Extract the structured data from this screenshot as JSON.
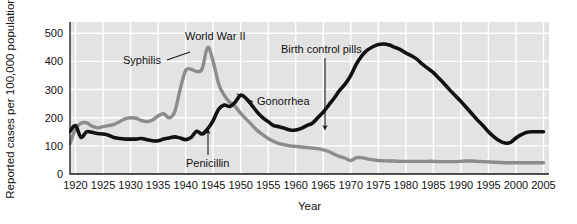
{
  "chart_data": {
    "type": "line",
    "title": "",
    "xlabel": "Year",
    "ylabel": "Reported cases per 100,000 population",
    "xlim": [
      1919,
      2006
    ],
    "ylim": [
      0,
      540
    ],
    "grid": true,
    "legend_position": "inline-annotations",
    "xticks": [
      1920,
      1925,
      1930,
      1935,
      1940,
      1945,
      1950,
      1955,
      1960,
      1965,
      1970,
      1975,
      1980,
      1985,
      1990,
      1995,
      2000,
      2005
    ],
    "xtick_labels": [
      "1920",
      "1925",
      "1930",
      "1935",
      "1940",
      "1945",
      "1950",
      "1955",
      "1960",
      "1965",
      "1970",
      "1975",
      "1980",
      "1985",
      "1990",
      "1995",
      "2000",
      "2005"
    ],
    "yticks": [
      0,
      100,
      200,
      300,
      400,
      500
    ],
    "ytick_labels": [
      "0",
      "100",
      "200",
      "300",
      "400",
      "500"
    ],
    "series": [
      {
        "name": "Syphilis",
        "color": "#8c8c8c",
        "stroke_width": 3.4,
        "x": [
          1919,
          1920,
          1921,
          1922,
          1923,
          1924,
          1925,
          1926,
          1927,
          1928,
          1929,
          1930,
          1931,
          1932,
          1933,
          1934,
          1935,
          1936,
          1937,
          1938,
          1939,
          1940,
          1941,
          1942,
          1943,
          1944,
          1945,
          1946,
          1947,
          1948,
          1949,
          1950,
          1951,
          1952,
          1953,
          1954,
          1955,
          1956,
          1957,
          1958,
          1959,
          1960,
          1961,
          1962,
          1963,
          1964,
          1965,
          1966,
          1967,
          1968,
          1969,
          1970,
          1971,
          1972,
          1973,
          1974,
          1975,
          1976,
          1977,
          1978,
          1979,
          1980,
          1981,
          1982,
          1983,
          1984,
          1985,
          1986,
          1987,
          1988,
          1989,
          1990,
          1991,
          1992,
          1993,
          1994,
          1995,
          1996,
          1997,
          1998,
          1999,
          2000,
          2001,
          2002,
          2003,
          2004,
          2005
        ],
        "y": [
          108,
          160,
          180,
          182,
          170,
          164,
          168,
          172,
          176,
          186,
          196,
          200,
          198,
          190,
          186,
          192,
          206,
          214,
          200,
          220,
          300,
          368,
          372,
          364,
          374,
          450,
          400,
          320,
          280,
          255,
          240,
          215,
          195,
          175,
          155,
          140,
          126,
          116,
          108,
          104,
          100,
          98,
          96,
          94,
          92,
          90,
          86,
          80,
          70,
          62,
          56,
          48,
          58,
          58,
          54,
          50,
          48,
          47,
          46,
          46,
          45,
          45,
          45,
          45,
          45,
          45,
          45,
          44,
          44,
          44,
          44,
          45,
          46,
          46,
          45,
          44,
          43,
          42,
          41,
          40,
          40,
          40,
          40,
          40,
          40,
          40,
          40
        ]
      },
      {
        "name": "Gonorrhea",
        "color": "#111111",
        "stroke_width": 3.6,
        "x": [
          1919,
          1920,
          1921,
          1922,
          1923,
          1924,
          1925,
          1926,
          1927,
          1928,
          1929,
          1930,
          1931,
          1932,
          1933,
          1934,
          1935,
          1936,
          1937,
          1938,
          1939,
          1940,
          1941,
          1942,
          1943,
          1944,
          1945,
          1946,
          1947,
          1948,
          1949,
          1950,
          1951,
          1952,
          1953,
          1954,
          1955,
          1956,
          1957,
          1958,
          1959,
          1960,
          1961,
          1962,
          1963,
          1964,
          1965,
          1966,
          1967,
          1968,
          1969,
          1970,
          1971,
          1972,
          1973,
          1974,
          1975,
          1976,
          1977,
          1978,
          1979,
          1980,
          1981,
          1982,
          1983,
          1984,
          1985,
          1986,
          1987,
          1988,
          1989,
          1990,
          1991,
          1992,
          1993,
          1994,
          1995,
          1996,
          1997,
          1998,
          1999,
          2000,
          2001,
          2002,
          2003,
          2004,
          2005
        ],
        "y": [
          152,
          172,
          130,
          150,
          148,
          144,
          142,
          138,
          130,
          126,
          124,
          124,
          124,
          126,
          122,
          118,
          118,
          124,
          128,
          132,
          128,
          122,
          130,
          152,
          142,
          160,
          190,
          230,
          245,
          240,
          255,
          280,
          268,
          245,
          220,
          200,
          186,
          172,
          168,
          162,
          156,
          156,
          162,
          172,
          180,
          200,
          220,
          245,
          270,
          298,
          320,
          350,
          390,
          420,
          440,
          452,
          460,
          462,
          458,
          450,
          442,
          430,
          420,
          408,
          390,
          375,
          360,
          340,
          320,
          298,
          278,
          258,
          236,
          214,
          192,
          172,
          150,
          132,
          118,
          110,
          112,
          128,
          140,
          148,
          150,
          150,
          150
        ]
      }
    ],
    "annotations": [
      {
        "id": "syphilis-label",
        "text": "Syphilis",
        "text_x": 123,
        "text_y": 64,
        "anchor": "start",
        "leader": {
          "type": "line",
          "x1": 167,
          "y1": 60,
          "x2": 190,
          "y2": 52
        }
      },
      {
        "id": "world-war-ii-label",
        "text": "World War II",
        "text_x": 185,
        "text_y": 40,
        "anchor": "start",
        "leader": {
          "type": "none"
        }
      },
      {
        "id": "gonorrhea-label",
        "text": "Gonorrhea",
        "text_x": 257,
        "text_y": 105,
        "anchor": "start",
        "leader": {
          "type": "line",
          "x1": 253,
          "y1": 102,
          "x2": 237,
          "y2": 94
        }
      },
      {
        "id": "penicillin-label",
        "text": "Penicillin",
        "text_x": 186,
        "text_y": 167,
        "anchor": "start",
        "leader": {
          "type": "arrow",
          "x1": 208,
          "y1": 155,
          "x2": 208,
          "y2": 131
        }
      },
      {
        "id": "birth-control-pills-label",
        "text": "Birth control pills",
        "text_x": 281,
        "text_y": 53,
        "anchor": "start",
        "leader": {
          "type": "arrow",
          "x1": 325,
          "y1": 58,
          "x2": 325,
          "y2": 128
        }
      }
    ]
  },
  "figure": {
    "plot_left": 70,
    "plot_right": 549,
    "plot_top": 22,
    "plot_bottom": 174,
    "background": "#ffffff",
    "plot_background": "#e3e3e3",
    "gridline_color": "#ffffff",
    "axis_color": "#1a1a1a"
  }
}
